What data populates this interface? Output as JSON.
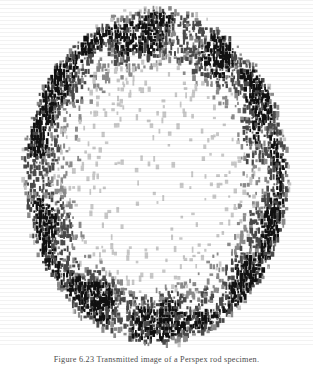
{
  "figure": {
    "plate_name": "halftone-scan-plate",
    "caption_prefix": "Figure",
    "caption_number": "6.23",
    "caption_text": "Figure   6.23 Transmitted image of a Perspex rod specimen.",
    "background_color": "#ffffff",
    "ink_color": "#111111",
    "mid_tone_color": "#6e6e6e"
  },
  "chart_data": {
    "type": "heatmap",
    "title": "",
    "subtitle": "",
    "xlabel": "",
    "ylabel": "",
    "grid": false,
    "legend_position": "none",
    "rendering": "dithered-halftone",
    "colormap": [
      "#ffffff",
      "#c8c8c8",
      "#8c8c8c",
      "#4a4a4a",
      "#111111"
    ],
    "xlim": [
      0,
      104
    ],
    "ylim": [
      0,
      116
    ],
    "cell_width_px": 3,
    "cell_height_px": 3,
    "annotations": [],
    "field": {
      "description": "Elliptical object: dense dark absorbing rim, sparse light interior, white surround.",
      "shape": "ellipse",
      "center_x_px": 156,
      "center_y_px": 176,
      "radius_x_px": 133,
      "radius_y_px": 168,
      "rim_inner_fraction": 0.63,
      "rim_peak_fraction": 0.92,
      "rim_density": 0.93,
      "core_density": 0.085,
      "outside_density": 0.0,
      "top_rim_boost": 1.15,
      "bottom_rim_boost": 1.12,
      "noise_seed": 20231107
    }
  }
}
